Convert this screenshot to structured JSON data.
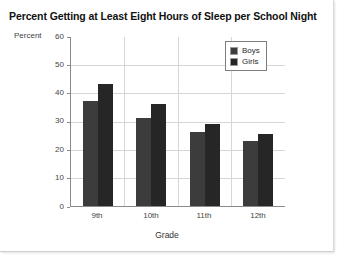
{
  "chart_data": {
    "type": "bar",
    "title": "Percent Getting at Least Eight Hours of Sleep per School Night",
    "xlabel": "Grade",
    "ylabel": "Percent",
    "categories": [
      "9th",
      "10th",
      "11th",
      "12th"
    ],
    "series": [
      {
        "name": "Boys",
        "values": [
          37,
          31,
          26,
          23
        ],
        "color": "#3c3c3c"
      },
      {
        "name": "Girls",
        "values": [
          43,
          36,
          29,
          25.5
        ],
        "color": "#262626"
      }
    ],
    "ylim": [
      0,
      60
    ],
    "yticks": [
      0,
      10,
      20,
      30,
      40,
      50,
      60
    ],
    "ytick_labels": [
      "0",
      "10",
      "20",
      "30",
      "40",
      "50",
      "60"
    ],
    "grid": true,
    "legend_position": "top-right",
    "legend_entries": [
      "Boys",
      "Girls"
    ]
  }
}
